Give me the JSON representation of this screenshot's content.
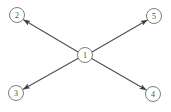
{
  "figure": {
    "background_color": "#ffffff",
    "width": 171,
    "height": 112
  },
  "style": {
    "node_fill": "#ffffff",
    "node_stroke": "#6e6e6e",
    "label_color": "#4a4a4a",
    "edge_color": "#4f4f4f",
    "node_radius": 7.5
  },
  "nodes": [
    {
      "id": "1",
      "label": "1",
      "role": "center",
      "x": 85,
      "y": 55
    },
    {
      "id": "2",
      "label": "2",
      "role": "leaf",
      "x": 17,
      "y": 15
    },
    {
      "id": "5",
      "label": "5",
      "role": "leaf",
      "x": 154,
      "y": 16
    },
    {
      "id": "3",
      "label": "3",
      "role": "leaf",
      "x": 16,
      "y": 93
    },
    {
      "id": "4",
      "label": "4",
      "role": "leaf",
      "x": 153,
      "y": 94
    }
  ],
  "edges": [
    {
      "id": "e1",
      "from": "1",
      "to": "2",
      "directed": true,
      "arrow_at": "to"
    },
    {
      "id": "e2",
      "from": "1",
      "to": "5",
      "directed": true,
      "arrow_at": "to"
    },
    {
      "id": "e3",
      "from": "1",
      "to": "3",
      "directed": true,
      "arrow_at": "to"
    },
    {
      "id": "e4",
      "from": "1",
      "to": "4",
      "directed": true,
      "arrow_at": "to"
    }
  ]
}
